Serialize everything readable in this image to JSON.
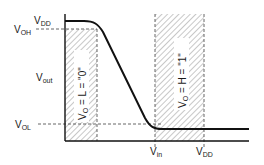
{
  "diagram": {
    "type": "inverter voltage transfer characteristic",
    "y_axis_label": {
      "main": "V",
      "sub": "out"
    },
    "x_labels": [
      {
        "main": "V",
        "sub": "in"
      },
      {
        "main": "V",
        "sub": "DD"
      }
    ],
    "y_labels": {
      "vdd": {
        "main": "V",
        "sub": "DD"
      },
      "voh": {
        "main": "V",
        "sub": "OH"
      },
      "vol": {
        "main": "V",
        "sub": "OL"
      }
    },
    "regions": [
      {
        "label_main": "V",
        "label_sub": "O",
        "label_rest": " = L = \"0\""
      },
      {
        "label_main": "V",
        "label_sub": "O",
        "label_rest": " = H = \"1\""
      }
    ],
    "colors": {
      "line": "#111111",
      "hatch": "#9a9a9a",
      "dash": "#555555"
    }
  }
}
